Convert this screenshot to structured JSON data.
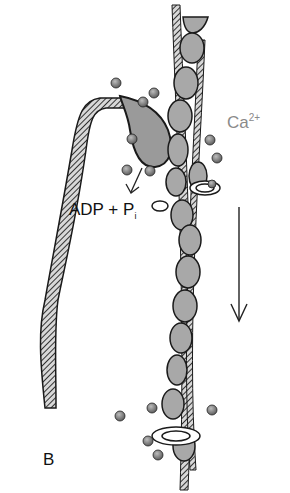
{
  "figure": {
    "panel_label": "B",
    "labels": {
      "calcium": "Ca",
      "calcium_charge": "2+",
      "adp": "ADP + P",
      "phosphate_sub": "i"
    },
    "components": {
      "actin_globules": 14,
      "troponin_complexes": 3,
      "calcium_ions": 16,
      "myosin_heads": 1,
      "direction_arrow": "down"
    },
    "colors": {
      "actin": "#a8a8a8",
      "outline": "#1a1a1a",
      "strand_hatch": "#555555",
      "calcium_text": "#8a8a8a",
      "background": "#ffffff"
    }
  }
}
